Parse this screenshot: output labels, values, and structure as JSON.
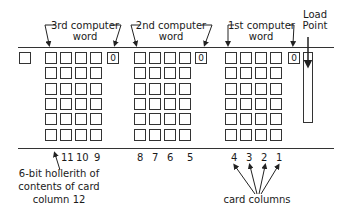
{
  "diagram": {
    "words": [
      {
        "id": "third",
        "label_line1": "3rd computer",
        "label_line2": "word",
        "zero_label": "0",
        "x": 45,
        "zero_x": 107
      },
      {
        "id": "second",
        "label_line1": "2nd computer",
        "label_line2": "word",
        "zero_label": "0",
        "x": 134,
        "zero_x": 195
      },
      {
        "id": "first",
        "label_line1": "1st computer",
        "label_line2": "word",
        "zero_label": "0",
        "x": 225,
        "zero_x": 288
      }
    ],
    "load_point": {
      "line1": "Load",
      "line2": "Point"
    },
    "grid": {
      "rows": 6,
      "cols": 4
    },
    "column_numbers": {
      "third": [
        "11",
        "10",
        "9"
      ],
      "second": [
        "8",
        "7",
        "6",
        "5"
      ],
      "first": [
        "4",
        "3",
        "2",
        "1"
      ]
    },
    "annotations": {
      "hollerith_line1": "6-bit hollerith of",
      "hollerith_line2": "contents of card",
      "hollerith_line3": "column 12",
      "card_columns": "card columns"
    }
  }
}
